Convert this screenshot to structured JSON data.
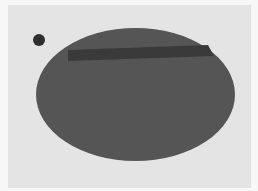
{
  "image": {
    "width": 258,
    "height": 191,
    "description": "Grayscale figure: a large dark-gray ellipse with a darker horizontal bar near its top, and a small dark dot at upper left, on a light gray panel."
  },
  "colors": {
    "outer_border": "#f7f7f7",
    "panel": "#e4e4e4",
    "ellipse": "#555555",
    "bar": "#3a3a3a",
    "dot": "#2e2e2e"
  },
  "shapes": {
    "ellipse": {
      "cx": 135.5,
      "cy": 94.5,
      "rx": 99.5,
      "ry": 66.5
    },
    "bar": {
      "points": "68,50 208,45 214,56 68,61"
    },
    "dot": {
      "cx": 39,
      "cy": 40,
      "r": 6
    }
  }
}
